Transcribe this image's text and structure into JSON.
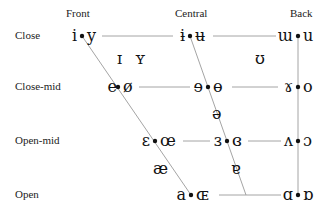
{
  "columns": {
    "front": "Front",
    "central": "Central",
    "back": "Back"
  },
  "rows": {
    "close": "Close",
    "close_mid": "Close-mid",
    "open_mid": "Open-mid",
    "open": "Open"
  },
  "vowels": {
    "close_front": {
      "unrounded": "i",
      "rounded": "y"
    },
    "close_central": {
      "unrounded": "ɨ",
      "rounded": "ʉ"
    },
    "close_back": {
      "unrounded": "ɯ",
      "rounded": "u"
    },
    "near_close_front": {
      "unrounded": "ɪ",
      "rounded": "ʏ"
    },
    "near_close_back": {
      "rounded": "ʊ"
    },
    "close_mid_front": {
      "unrounded": "e",
      "rounded": "ø"
    },
    "close_mid_central": {
      "unrounded": "ɘ",
      "rounded": "ɵ"
    },
    "close_mid_back": {
      "unrounded": "ɤ",
      "rounded": "o"
    },
    "mid_central": {
      "symbol": "ə"
    },
    "open_mid_front": {
      "unrounded": "ɛ",
      "rounded": "œ"
    },
    "open_mid_central": {
      "unrounded": "ɜ",
      "rounded": "ɞ"
    },
    "open_mid_back": {
      "unrounded": "ʌ",
      "rounded": "ɔ"
    },
    "near_open_front": {
      "symbol": "æ"
    },
    "near_open_central": {
      "symbol": "ɐ"
    },
    "open_front": {
      "unrounded": "a",
      "rounded": "ɶ"
    },
    "open_back": {
      "unrounded": "ɑ",
      "rounded": "ɒ"
    }
  },
  "colors": {
    "line": "#9a9a9a",
    "text": "#111111"
  }
}
